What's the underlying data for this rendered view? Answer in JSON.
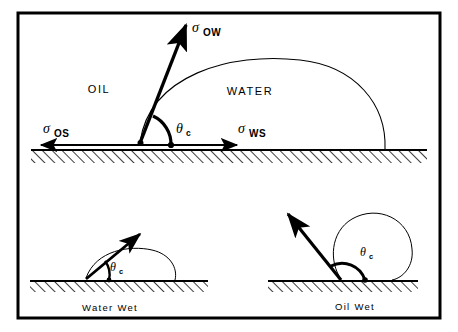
{
  "figure": {
    "frame_color": "#000000",
    "background_color": "#ffffff",
    "line_color": "#000000"
  },
  "main_panel": {
    "region_labels": {
      "oil": "OIL",
      "water": "WATER"
    },
    "vectors": [
      {
        "name": "sigma-ow",
        "symbol": "σ",
        "subscript": "OW",
        "direction": "up-right"
      },
      {
        "name": "sigma-os",
        "symbol": "σ",
        "subscript": "OS",
        "direction": "left"
      },
      {
        "name": "sigma-ws",
        "symbol": "σ",
        "subscript": "WS",
        "direction": "right"
      }
    ],
    "angle": {
      "symbol": "θ",
      "subscript": "c"
    }
  },
  "lower_left_panel": {
    "caption": "Water Wet",
    "angle": {
      "symbol": "θ",
      "subscript": "c"
    }
  },
  "lower_right_panel": {
    "caption": "Oil Wet",
    "angle": {
      "symbol": "θ",
      "subscript": "c"
    }
  }
}
